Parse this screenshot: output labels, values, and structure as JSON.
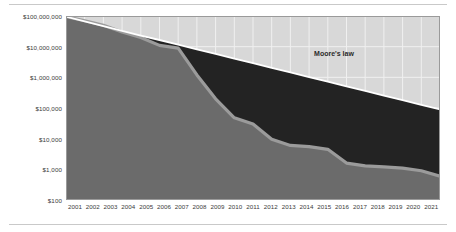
{
  "chart_data": {
    "type": "area",
    "title": "",
    "subtitle": "",
    "xlabel": "",
    "ylabel": "",
    "scale": "log",
    "grid": true,
    "legend_position": "inline-annotation",
    "ylim": [
      100,
      100000000
    ],
    "xlim": [
      2001,
      2021
    ],
    "ytick_labels": [
      "$100,000,000",
      "$10,000,000",
      "$1,000,000",
      "$100,000",
      "$10,000",
      "$1,000",
      "$100"
    ],
    "ytick_values": [
      100000000,
      10000000,
      1000000,
      100000,
      10000,
      1000,
      100
    ],
    "categories": [
      "2001",
      "2002",
      "2003",
      "2004",
      "2005",
      "2006",
      "2007",
      "2008",
      "2009",
      "2010",
      "2011",
      "2012",
      "2013",
      "2014",
      "2015",
      "2016",
      "2017",
      "2018",
      "2019",
      "2020",
      "2021"
    ],
    "annotations": [
      {
        "text": "Moore's law",
        "x": 2017.5,
        "y": 4000000
      }
    ],
    "series": [
      {
        "name": "Moore's law",
        "type": "line",
        "color": "#ffffff",
        "values": [
          95000000,
          67000000,
          47000000,
          33000000,
          23000000,
          16500000,
          11600000,
          8200000,
          5800000,
          4100000,
          2900000,
          2050000,
          1450000,
          1020000,
          720000,
          510000,
          360000,
          255000,
          180000,
          127000,
          90000
        ]
      },
      {
        "name": "Cost per genome",
        "type": "area",
        "color": "#6b6b6b",
        "line_color": "#9b9b9b",
        "values": [
          95000000,
          70000000,
          50000000,
          30000000,
          20000000,
          11000000,
          9000000,
          1200000,
          200000,
          48000,
          30000,
          9500,
          6000,
          5500,
          4500,
          1600,
          1300,
          1200,
          1100,
          900,
          600
        ]
      }
    ],
    "fill_between": {
      "name": "gap-above-cost-below-moores-law",
      "color": "#232323"
    }
  },
  "colors": {
    "plot_background": "#d8d8d8",
    "gridline": "#f0f0f0",
    "cost_area": "#6b6b6b",
    "cost_line": "#9b9b9b",
    "gap_fill": "#232323",
    "moores_law_line": "#ffffff",
    "axis_text": "#3a3a3a",
    "rule": "#c9c9c9",
    "plot_border": "#9a9a9a"
  }
}
